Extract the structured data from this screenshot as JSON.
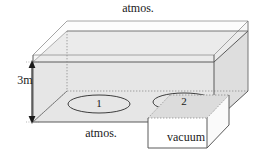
{
  "figure": {
    "type": "engineering-diagram",
    "labels": {
      "atmos_top": "atmos.",
      "atmos_bottom": "atmos.",
      "vacuum": "vacuum",
      "depth": "3m",
      "point_1": "1",
      "point_2": "2"
    },
    "colors": {
      "liquid_fill": "#e6e6e6",
      "rim_fill": "#f2f2f2",
      "outline": "#4d4d4d",
      "hidden_edge": "#8c8c8c",
      "text": "#1a1a1a",
      "background": "#ffffff"
    }
  }
}
